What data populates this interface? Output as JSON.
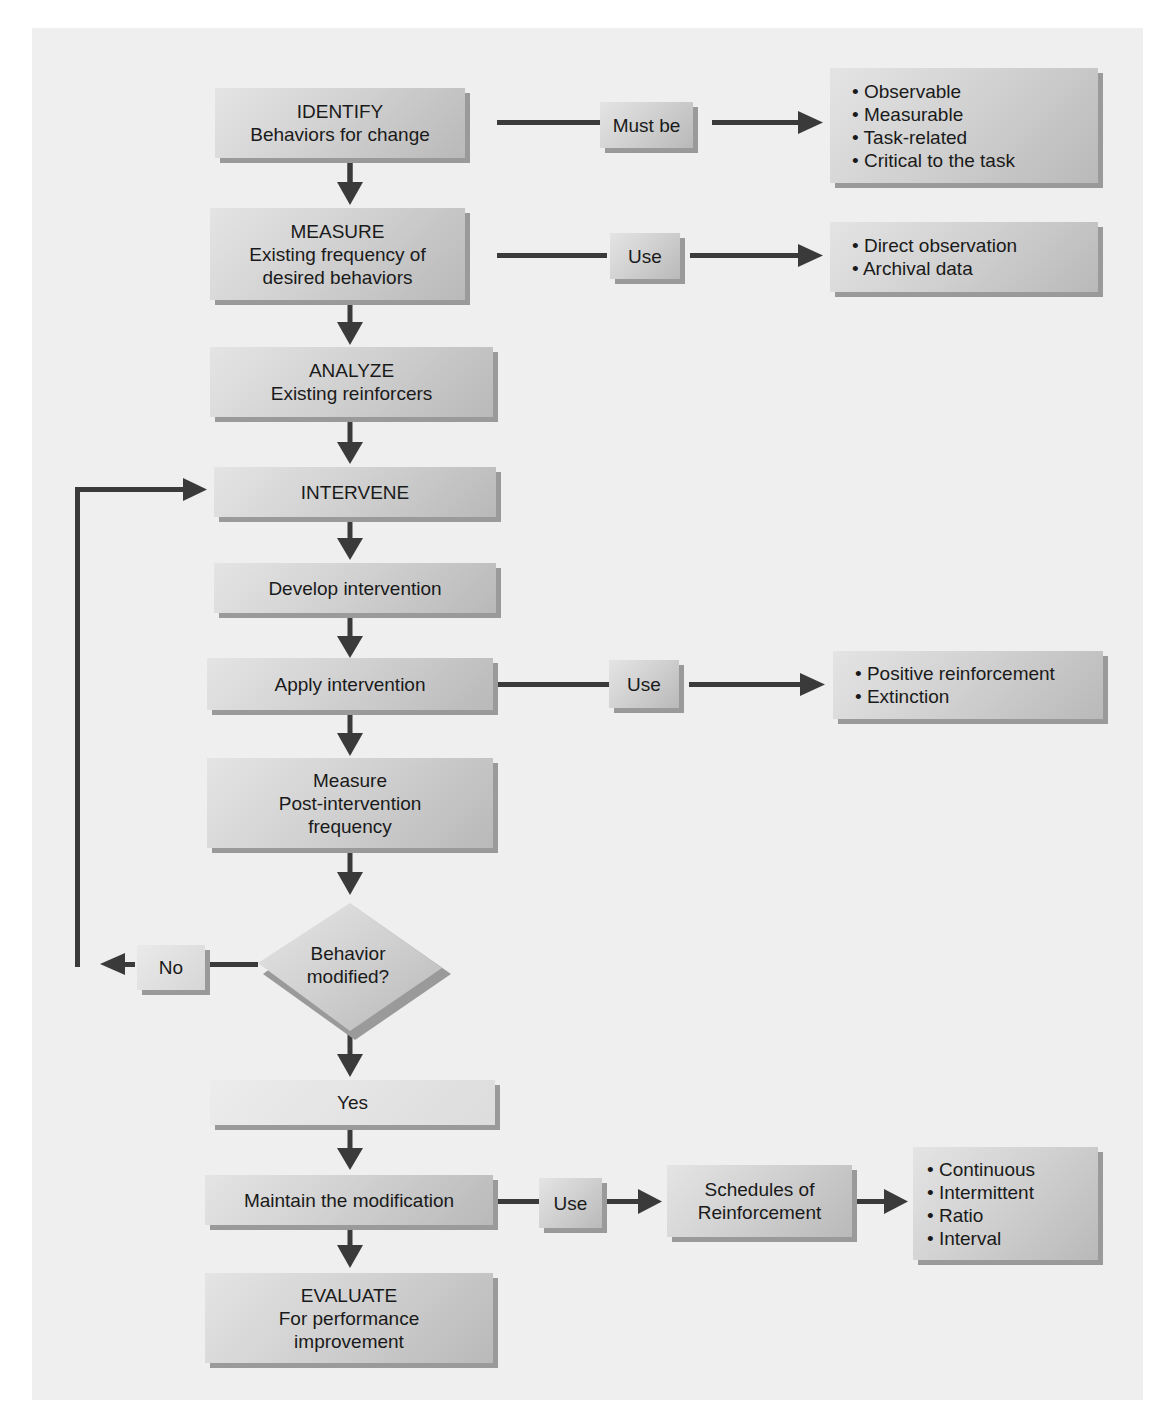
{
  "colors": {
    "panel": "#efefef",
    "arrow": "#3a3a3a",
    "box_light": "#e4e4e4",
    "box_dark": "#b9b9b9",
    "shadow": "#9a9a9a"
  },
  "flow": {
    "identify": {
      "title": "IDENTIFY",
      "subtitle": "Behaviors for change"
    },
    "measure": {
      "title": "MEASURE",
      "line1": "Existing frequency of",
      "line2": "desired behaviors"
    },
    "analyze": {
      "title": "ANALYZE",
      "subtitle": "Existing reinforcers"
    },
    "intervene": {
      "title": "INTERVENE"
    },
    "develop": {
      "label": "Develop intervention"
    },
    "apply": {
      "label": "Apply intervention"
    },
    "measure_post": {
      "line1": "Measure",
      "line2": "Post-intervention",
      "line3": "frequency"
    },
    "decision": {
      "line1": "Behavior",
      "line2": "modified?"
    },
    "no_label": "No",
    "yes_label": "Yes",
    "maintain": {
      "label": "Maintain the modification"
    },
    "evaluate": {
      "title": "EVALUATE",
      "line1": "For performance",
      "line2": "improvement"
    }
  },
  "connectors": {
    "must_be": "Must be",
    "use_measure": "Use",
    "use_apply": "Use",
    "use_maintain": "Use"
  },
  "side": {
    "identify_criteria": [
      "• Observable",
      "• Measurable",
      "• Task-related",
      "• Critical to the task"
    ],
    "measure_methods": [
      "• Direct observation",
      "• Archival data"
    ],
    "apply_methods": [
      "• Positive reinforcement",
      "• Extinction"
    ],
    "schedules": {
      "line1": "Schedules of",
      "line2": "Reinforcement"
    },
    "schedule_types": [
      "• Continuous",
      "• Intermittent",
      "• Ratio",
      "• Interval"
    ]
  }
}
